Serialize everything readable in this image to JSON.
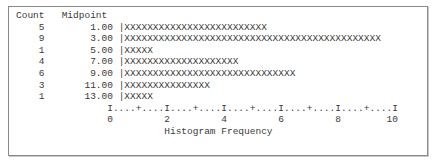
{
  "header": {
    "count_label": "Count",
    "midpoint_label": "Midpoint"
  },
  "rows": [
    {
      "count": "5",
      "midpoint": "1.00",
      "bar": "|XXXXXXXXXXXXXXXXXXXXXXXXX"
    },
    {
      "count": "9",
      "midpoint": "3.00",
      "bar": "|XXXXXXXXXXXXXXXXXXXXXXXXXXXXXXXXXXXXXXXXXXXXX"
    },
    {
      "count": "1",
      "midpoint": "5.00",
      "bar": "|XXXXX"
    },
    {
      "count": "4",
      "midpoint": "7.00",
      "bar": "|XXXXXXXXXXXXXXXXXXXX"
    },
    {
      "count": "6",
      "midpoint": "9.00",
      "bar": "|XXXXXXXXXXXXXXXXXXXXXXXXXXXXXX"
    },
    {
      "count": "3",
      "midpoint": "11.00",
      "bar": "|XXXXXXXXXXXXXXX"
    },
    {
      "count": "1",
      "midpoint": "13.00",
      "bar": "|XXXXX"
    }
  ],
  "axis": {
    "ruler": "I....+....I....+....I....+....I....+....I....+....I",
    "ticks": "0         2         4         6         8        10",
    "label": "Histogram Frequency"
  },
  "chart_data": {
    "type": "bar",
    "orientation": "horizontal",
    "title": "",
    "xlabel": "Histogram Frequency",
    "ylabel": "Midpoint",
    "categories": [
      "1.00",
      "3.00",
      "5.00",
      "7.00",
      "9.00",
      "11.00",
      "13.00"
    ],
    "values": [
      5,
      9,
      1,
      4,
      6,
      3,
      1
    ],
    "xlim": [
      0,
      10
    ],
    "x_ticks": [
      0,
      2,
      4,
      6,
      8,
      10
    ],
    "bar_glyph": "X",
    "chars_per_unit": 5,
    "grid": false,
    "legend": null
  }
}
